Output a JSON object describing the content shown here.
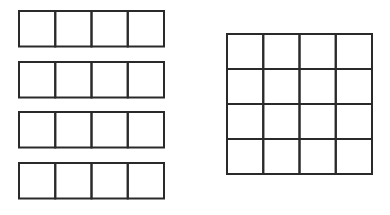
{
  "diagram": {
    "stroke_color": "#2a2a2a",
    "background": "#ffffff",
    "left_strips": {
      "count": 4,
      "cells_per_strip": 4,
      "x": 19,
      "cell_w": 36.25,
      "cell_h": 35.5,
      "y_positions": [
        11,
        62,
        112,
        163
      ]
    },
    "right_grid": {
      "rows": 4,
      "cols": 4,
      "x": 227,
      "y": 34,
      "cell_w": 36.25,
      "cell_h": 35
    }
  }
}
